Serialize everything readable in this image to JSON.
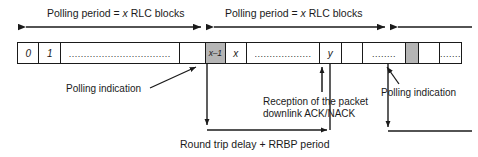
{
  "figure": {
    "ink_color": "#1a1a1a",
    "shade_color": "#b5b5b5",
    "background": "#ffffff"
  },
  "periods": [
    {
      "id": "period-1",
      "label": "Polling period = x RLC blocks"
    },
    {
      "id": "period-2",
      "label": "Polling period = x RLC blocks"
    }
  ],
  "strip": {
    "cells": [
      {
        "id": "cell-0",
        "text": "0",
        "style": "plain",
        "width": 22
      },
      {
        "id": "cell-1",
        "text": "1",
        "style": "plain",
        "width": 22
      },
      {
        "id": "cell-2",
        "text": "..................................",
        "style": "dots",
        "width": 122
      },
      {
        "id": "cell-3",
        "text": "",
        "style": "plain",
        "width": 27
      },
      {
        "id": "cell-4",
        "text": "x–1",
        "style": "shaded-small",
        "width": 20
      },
      {
        "id": "cell-5",
        "text": "x",
        "style": "plain",
        "width": 22
      },
      {
        "id": "cell-6",
        "text": "...................",
        "style": "dots",
        "width": 75
      },
      {
        "id": "cell-7",
        "text": "y",
        "style": "plain",
        "width": 22
      },
      {
        "id": "cell-8",
        "text": "",
        "style": "plain",
        "width": 22
      },
      {
        "id": "cell-9",
        "text": "........",
        "style": "dots",
        "width": 44
      },
      {
        "id": "cell-10",
        "text": "",
        "style": "shaded",
        "width": 13
      },
      {
        "id": "cell-11",
        "text": "",
        "style": "plain",
        "width": 22
      },
      {
        "id": "cell-12",
        "text": ".......",
        "style": "dots",
        "width": 49
      }
    ]
  },
  "callouts": {
    "polling_indication_left": "Polling indication",
    "polling_indication_right": "Polling indication",
    "reception_line1": "Reception of the packet",
    "reception_line2": "downlink ACK/NACK",
    "round_trip": "Round trip delay + RRBP period"
  }
}
